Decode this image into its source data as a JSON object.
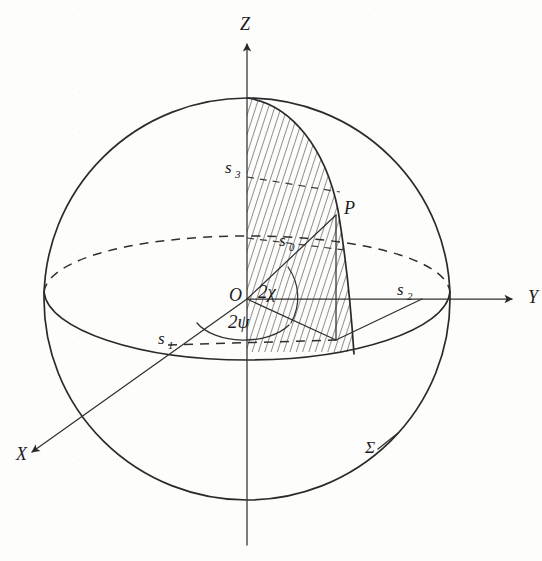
{
  "figure": {
    "type": "geometric-diagram",
    "background_color": "#fdfdfc",
    "ink_color": "#2a2a2a"
  },
  "axes": [
    {
      "id": "x-axis",
      "label": "X",
      "x": 16,
      "y": 460,
      "direction": "down-left"
    },
    {
      "id": "y-axis",
      "label": "Y",
      "x": 528,
      "y": 303,
      "direction": "right"
    },
    {
      "id": "z-axis",
      "label": "Z",
      "x": 240,
      "y": 30,
      "direction": "up"
    }
  ],
  "points": [
    {
      "id": "origin",
      "label": "O",
      "x": 229,
      "y": 301
    },
    {
      "id": "point-p",
      "label": "P",
      "x": 344,
      "y": 214
    }
  ],
  "stokes_labels": [
    {
      "id": "s0",
      "base": "s",
      "sub": "0",
      "x": 279,
      "y": 246
    },
    {
      "id": "s1",
      "base": "s",
      "sub": "1",
      "x": 158,
      "y": 344
    },
    {
      "id": "s2",
      "base": "s",
      "sub": "2",
      "x": 397,
      "y": 295
    },
    {
      "id": "s3",
      "base": "s",
      "sub": "3",
      "x": 225,
      "y": 173
    }
  ],
  "angles": [
    {
      "id": "angle-2chi",
      "label": "2χ",
      "x": 258,
      "y": 298,
      "description": "ellipticity angle at origin"
    },
    {
      "id": "angle-2psi",
      "label": "2ψ",
      "x": 228,
      "y": 328,
      "description": "azimuth angle in equatorial plane"
    }
  ],
  "surface": {
    "id": "sigma",
    "label": "Σ",
    "x": 365,
    "y": 453,
    "description": "sphere surface"
  },
  "geometry": {
    "sphere_center_x": 247,
    "sphere_center_y": 299,
    "sphere_radius": 202,
    "equator_ry": 62,
    "hatched_region": "meridian sector from north pole to P",
    "hatch_angle_deg": 18,
    "hatch_spacing_px": 6
  }
}
